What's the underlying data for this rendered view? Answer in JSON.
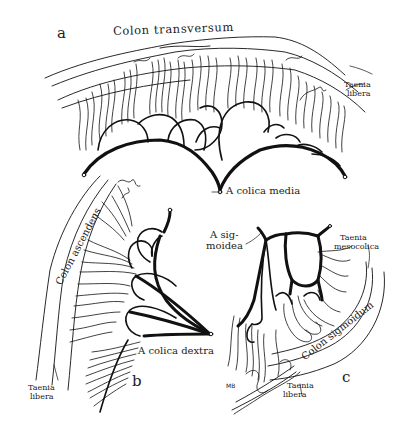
{
  "figure": {
    "panels": [
      {
        "id": "a",
        "letter": "a"
      },
      {
        "id": "b",
        "letter": "b"
      },
      {
        "id": "c",
        "letter": "c"
      }
    ],
    "labels": {
      "colon_transversum": "Colon transversum",
      "taenia_libera_a_line1": "Taenia",
      "taenia_libera_a_line2": "libera",
      "a_colica_media": "A colica media",
      "colon_ascendens": "Colon ascendens",
      "a_colica_dextra": "A colica dextra",
      "taenia_libera_b_line1": "Taenia",
      "taenia_libera_b_line2": "libera",
      "a_sigmoidea_line1": "A sig-",
      "a_sigmoidea_line2": "moidea",
      "taenia_mesocolica_line1": "Taenia",
      "taenia_mesocolica_line2": "mesocolica",
      "colon_sigmoidum": "Colon sigmoidum",
      "taenia_libera_c_line1": "Taenia",
      "taenia_libera_c_line2": "libera",
      "signature": "MB"
    },
    "colors": {
      "ink": "#111111",
      "paper": "#ffffff"
    }
  }
}
